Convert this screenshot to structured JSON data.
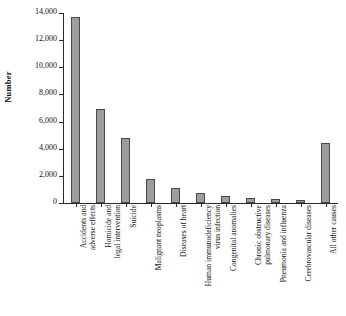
{
  "chart_data": {
    "type": "bar",
    "title": "",
    "xlabel": "",
    "ylabel": "Number",
    "ylim": [
      0,
      14000
    ],
    "yticks": [
      0,
      2000,
      4000,
      6000,
      8000,
      10000,
      12000,
      14000
    ],
    "ytick_labels": [
      "0",
      "2,000",
      "4,000",
      "6,000",
      "8,000",
      "10,000",
      "12,000",
      "14,000"
    ],
    "grid": false,
    "legend": false,
    "bar_color": "#9d9d9d",
    "bar_edge_color": "#4a4a4a",
    "categories": [
      "Accidents and\nadverse effects",
      "Homicide and\nlegal intervention",
      "Suicide",
      "Malignant neoplasms",
      "Diseases of heart",
      "Human immunodeficiency\nvirus infection",
      "Congenital anomalies",
      "Chronic obstructive\npulmonary diseases",
      "Pneumonia and influenza",
      "Cerebrovascular diseases",
      "All other causes"
    ],
    "values": [
      13700,
      6900,
      4800,
      1800,
      1100,
      750,
      500,
      350,
      300,
      250,
      4400
    ]
  }
}
